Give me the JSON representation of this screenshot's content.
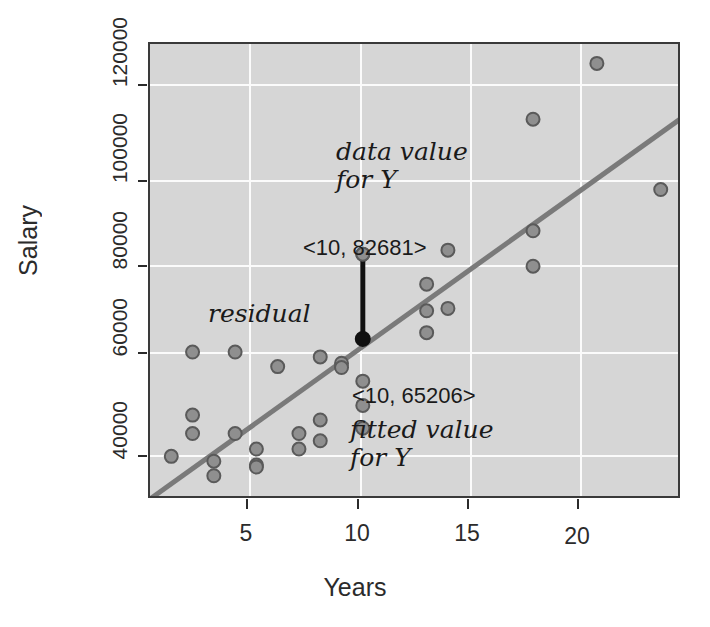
{
  "chart_data": {
    "type": "scatter",
    "title": "",
    "xlabel": "Years",
    "ylabel": "Salary",
    "xlim": [
      0,
      25
    ],
    "ylim": [
      32000,
      126000
    ],
    "grid": true,
    "legend": false,
    "xticks": [
      5,
      10,
      15,
      20
    ],
    "xtick_labels": [
      "5",
      "10",
      "15",
      "20"
    ],
    "yticks": [
      40000,
      60000,
      80000,
      100000,
      120000
    ],
    "ytick_labels": [
      "40000",
      "60000",
      "80000",
      "100000",
      "120000"
    ],
    "series": [
      {
        "name": "observations",
        "type": "scatter",
        "marker": "circle",
        "color": "#8f8f8f",
        "edge_color": "#5a5a5a",
        "points": [
          {
            "x": 1.0,
            "y": 41000
          },
          {
            "x": 2.0,
            "y": 62500
          },
          {
            "x": 2.0,
            "y": 49500
          },
          {
            "x": 2.0,
            "y": 45700
          },
          {
            "x": 3.0,
            "y": 40000
          },
          {
            "x": 3.0,
            "y": 37000
          },
          {
            "x": 4.0,
            "y": 62500
          },
          {
            "x": 4.0,
            "y": 45700
          },
          {
            "x": 5.0,
            "y": 42500
          },
          {
            "x": 5.0,
            "y": 39200
          },
          {
            "x": 5.0,
            "y": 38800
          },
          {
            "x": 6.0,
            "y": 59500
          },
          {
            "x": 7.0,
            "y": 45700
          },
          {
            "x": 7.0,
            "y": 42500
          },
          {
            "x": 8.0,
            "y": 61500
          },
          {
            "x": 8.0,
            "y": 48500
          },
          {
            "x": 8.0,
            "y": 44200
          },
          {
            "x": 9.0,
            "y": 60200
          },
          {
            "x": 9.0,
            "y": 59300
          },
          {
            "x": 10.0,
            "y": 82681
          },
          {
            "x": 10.0,
            "y": 56500
          },
          {
            "x": 10.0,
            "y": 51500
          },
          {
            "x": 10.0,
            "y": 46800
          },
          {
            "x": 13.0,
            "y": 76500
          },
          {
            "x": 13.0,
            "y": 71000
          },
          {
            "x": 13.0,
            "y": 66500
          },
          {
            "x": 14.0,
            "y": 83500
          },
          {
            "x": 14.0,
            "y": 71500
          },
          {
            "x": 18.0,
            "y": 110500
          },
          {
            "x": 18.0,
            "y": 87500
          },
          {
            "x": 18.0,
            "y": 80200
          },
          {
            "x": 21.0,
            "y": 122000
          },
          {
            "x": 24.0,
            "y": 96000
          }
        ]
      },
      {
        "name": "fitted-regression-line",
        "type": "line",
        "color": "#7a7a7a",
        "x_start": 0.0,
        "y_start": 32200,
        "x_end": 25.0,
        "y_end": 110800
      },
      {
        "name": "residual-segment",
        "type": "segment",
        "color": "#111111",
        "x": 10,
        "y_top": 82681,
        "y_bottom": 65206
      }
    ],
    "highlight_points": [
      {
        "name": "data-value-point",
        "x": 10,
        "y": 82681,
        "color": "#8f8f8f"
      },
      {
        "name": "fitted-value-point",
        "x": 10,
        "y": 65206,
        "color": "#111111"
      }
    ],
    "annotations": [
      {
        "name": "data-value-label",
        "text_line1": "data value",
        "text_line2": "for Y",
        "style": "script-italic"
      },
      {
        "name": "data-value-coordinate",
        "text": "<10, 82681>",
        "style": "sans"
      },
      {
        "name": "residual-label",
        "text": "residual",
        "style": "script-italic"
      },
      {
        "name": "fitted-value-coordinate",
        "text": "<10, 65206>",
        "style": "sans"
      },
      {
        "name": "fitted-value-label",
        "text_line1": "fitted value",
        "text_line2": "for Y",
        "style": "script-italic"
      }
    ]
  },
  "axes": {
    "y_title": "Salary",
    "x_title": "Years",
    "y_tick_labels": [
      "40000",
      "60000",
      "80000",
      "100000",
      "120000"
    ],
    "x_tick_labels": [
      "5",
      "10",
      "15",
      "20"
    ]
  },
  "annotations": {
    "data_value_line1": "data value",
    "data_value_line2": "for Y",
    "data_value_coord": "<10, 82681>",
    "residual": "residual",
    "fitted_value_coord": "<10, 65206>",
    "fitted_value_line1": "fitted value",
    "fitted_value_line2": "for Y"
  },
  "colors": {
    "panel_background": "#d6d6d6",
    "gridline": "#fbfbfb",
    "point_fill": "#8f8f8f",
    "point_edge": "#5a5a5a",
    "regression_line": "#7a7a7a",
    "residual_line": "#111111",
    "axis_text": "#2b2b2b"
  }
}
